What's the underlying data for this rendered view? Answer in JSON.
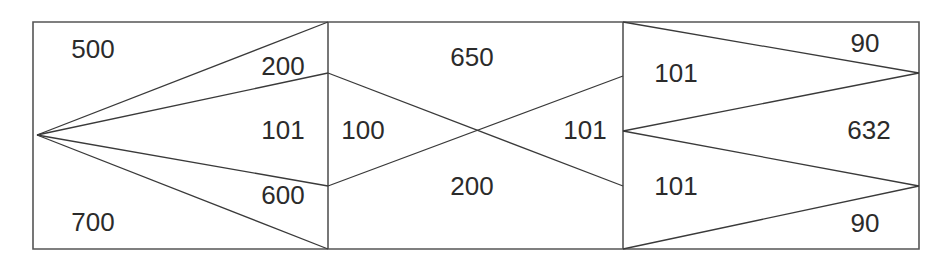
{
  "diagram": {
    "type": "three-panel-flow-diagram",
    "title": "",
    "canvas": {
      "width": 946,
      "height": 262
    },
    "stroke_color": "#3a3a3a",
    "border_color": "#555555",
    "background_color": "#ffffff",
    "text_color": "#2b2b2b",
    "panels": [
      {
        "id": "panel-left",
        "name": "left-panel",
        "x": 33,
        "y": 22,
        "width": 295,
        "height": 227,
        "fan_origin": {
          "x": 37,
          "y": 135
        },
        "labels": [
          {
            "id": "left-500",
            "name": "label-500",
            "text": "500",
            "x": 93,
            "y": 50,
            "anchor": "middle"
          },
          {
            "id": "left-200",
            "name": "label-200",
            "text": "200",
            "x": 283,
            "y": 67,
            "anchor": "middle"
          },
          {
            "id": "left-101",
            "name": "label-101",
            "text": "101",
            "x": 283,
            "y": 131,
            "anchor": "middle"
          },
          {
            "id": "left-600",
            "name": "label-600",
            "text": "600",
            "x": 283,
            "y": 196,
            "anchor": "middle"
          },
          {
            "id": "left-700",
            "name": "label-700",
            "text": "700",
            "x": 93,
            "y": 223,
            "anchor": "middle"
          }
        ],
        "lines": [
          {
            "id": "l1",
            "name": "flow-line-top",
            "x1": 37,
            "y1": 135,
            "x2": 328,
            "y2": 22
          },
          {
            "id": "l2",
            "name": "flow-line-upper-mid",
            "x1": 37,
            "y1": 135,
            "x2": 328,
            "y2": 73
          },
          {
            "id": "l3",
            "name": "flow-line-lower-mid",
            "x1": 37,
            "y1": 135,
            "x2": 328,
            "y2": 186
          },
          {
            "id": "l4",
            "name": "flow-line-bottom",
            "x1": 37,
            "y1": 135,
            "x2": 328,
            "y2": 249
          }
        ]
      },
      {
        "id": "panel-middle",
        "name": "middle-panel",
        "x": 328,
        "y": 22,
        "width": 295,
        "height": 227,
        "crossing_point": {
          "x": 478,
          "y": 131
        },
        "labels": [
          {
            "id": "mid-650",
            "name": "label-650",
            "text": "650",
            "x": 472,
            "y": 58,
            "anchor": "middle"
          },
          {
            "id": "mid-100",
            "name": "label-100",
            "text": "100",
            "x": 363,
            "y": 131,
            "anchor": "middle"
          },
          {
            "id": "mid-200",
            "name": "label-200",
            "text": "200",
            "x": 472,
            "y": 187,
            "anchor": "middle"
          },
          {
            "id": "mid-101",
            "name": "label-101",
            "text": "101",
            "x": 585,
            "y": 131,
            "anchor": "middle"
          }
        ],
        "lines": [
          {
            "id": "m1",
            "name": "flow-line-cross-down",
            "x1": 328,
            "y1": 73,
            "x2": 623,
            "y2": 186
          },
          {
            "id": "m2",
            "name": "flow-line-cross-up",
            "x1": 328,
            "y1": 186,
            "x2": 623,
            "y2": 76
          }
        ]
      },
      {
        "id": "panel-right",
        "name": "right-panel",
        "x": 623,
        "y": 22,
        "width": 296,
        "height": 227,
        "labels": [
          {
            "id": "right-90-top",
            "name": "label-90-top",
            "text": "90",
            "x": 865,
            "y": 44,
            "anchor": "middle"
          },
          {
            "id": "right-101-top",
            "name": "label-101-top",
            "text": "101",
            "x": 676,
            "y": 74,
            "anchor": "middle"
          },
          {
            "id": "right-632",
            "name": "label-632",
            "text": "632",
            "x": 869,
            "y": 131,
            "anchor": "middle"
          },
          {
            "id": "right-101-bottom",
            "name": "label-101-bottom",
            "text": "101",
            "x": 676,
            "y": 187,
            "anchor": "middle"
          },
          {
            "id": "right-90-bottom",
            "name": "label-90-bottom",
            "text": "90",
            "x": 865,
            "y": 224,
            "anchor": "middle"
          }
        ],
        "lines": [
          {
            "id": "r1",
            "name": "flow-line-upper-v-top",
            "x1": 623,
            "y1": 22,
            "x2": 919,
            "y2": 73
          },
          {
            "id": "r2",
            "name": "flow-line-upper-v-bottom",
            "x1": 919,
            "y1": 73,
            "x2": 623,
            "y2": 131
          },
          {
            "id": "r3",
            "name": "flow-line-lower-v-top",
            "x1": 623,
            "y1": 131,
            "x2": 919,
            "y2": 186
          },
          {
            "id": "r4",
            "name": "flow-line-lower-v-bottom",
            "x1": 919,
            "y1": 186,
            "x2": 623,
            "y2": 249
          }
        ]
      }
    ],
    "dividers": [
      {
        "id": "d-left",
        "name": "border-left-edge",
        "x1": 33,
        "y1": 22,
        "x2": 33,
        "y2": 249
      },
      {
        "id": "d-1",
        "name": "divider-first",
        "x1": 328,
        "y1": 22,
        "x2": 328,
        "y2": 249
      },
      {
        "id": "d-2",
        "name": "divider-second",
        "x1": 623,
        "y1": 22,
        "x2": 623,
        "y2": 249
      },
      {
        "id": "d-right",
        "name": "border-right-edge",
        "x1": 919,
        "y1": 22,
        "x2": 919,
        "y2": 249
      },
      {
        "id": "d-top",
        "name": "border-top-edge",
        "x1": 33,
        "y1": 22,
        "x2": 919,
        "y2": 22
      },
      {
        "id": "d-bottom",
        "name": "border-bottom-edge",
        "x1": 33,
        "y1": 249,
        "x2": 919,
        "y2": 249
      }
    ],
    "all_values": [
      500,
      200,
      101,
      600,
      700,
      650,
      100,
      200,
      101,
      90,
      101,
      632,
      101,
      90
    ]
  }
}
